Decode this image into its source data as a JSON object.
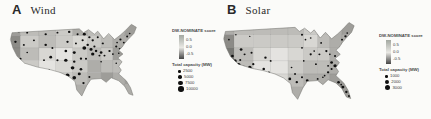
{
  "figure": {
    "background": "#fbfbf9"
  },
  "palette": {
    "grays": [
      "#f0efec",
      "#e4e3e0",
      "#d8d7d3",
      "#cbcac6",
      "#bdbcb8",
      "#aeada9",
      "#9e9d99",
      "#8c8b87",
      "#787874",
      "#616160"
    ],
    "dot_color": "#101010",
    "gradient_top": "#a3a8a1",
    "gradient_mid": "#e9e8e4",
    "gradient_bottom": "#454545",
    "outline_color": "#6e6e6a",
    "cell_border": "#00000022"
  },
  "us_outline": "M12,14 L92,9 L97,14 L103,10 L110,16 L114,12 L121,22 L127,15 L134,23 L141,17 L147,11 L154,3 L160,7 L157,15 L150,23 L146,28 L143,33 L139,37 L144,42 L138,47 L143,52 L139,58 L142,63 L139,68 L143,72 L148,77 L153,86 L156,96 L151,94 L146,84 L139,77 L130,73 L124,79 L118,74 L106,75 L101,83 L95,97 L89,89 L87,78 L79,71 L69,66 L56,62 L42,59 L27,54 L18,45 L13,34 L10,23 Z",
  "panels": [
    {
      "letter": "A",
      "title": "Wind",
      "score_legend": {
        "title": "DW-NOMINATE score",
        "ticks": [
          "0.5",
          "0.0",
          "-0.5"
        ]
      },
      "size_legend": {
        "title": "Total capacity (MW)",
        "items": [
          {
            "label": "2500",
            "d": 2.6
          },
          {
            "label": "5000",
            "d": 3.6
          },
          {
            "label": "7500",
            "d": 4.6
          },
          {
            "label": "10000",
            "d": 5.6
          }
        ]
      },
      "map": {
        "grid": {
          "cols": [
            0,
            22,
            44,
            64,
            84,
            102,
            118,
            132,
            146,
            160,
            174,
            200
          ],
          "rows": [
            0,
            18,
            34,
            50,
            66,
            82,
            110
          ],
          "shades": [
            "64435435676",
            "73432345567",
            "74213436566",
            "83123544565",
            "84234565656",
            "75345566567"
          ]
        },
        "dots": [
          [
            20,
            12,
            1.6
          ],
          [
            30,
            14,
            1.2
          ],
          [
            16,
            26,
            1.5
          ],
          [
            26,
            30,
            1.2
          ],
          [
            22,
            48,
            1.3
          ],
          [
            26,
            56,
            1.6
          ],
          [
            30,
            62,
            1.2
          ],
          [
            30,
            40,
            1.0
          ],
          [
            38,
            24,
            1.2
          ],
          [
            52,
            16,
            1.4
          ],
          [
            66,
            14,
            1.2
          ],
          [
            52,
            30,
            1.5
          ],
          [
            60,
            34,
            1.2
          ],
          [
            58,
            46,
            1.7
          ],
          [
            66,
            50,
            1.3
          ],
          [
            50,
            50,
            1.1
          ],
          [
            56,
            63,
            1.3
          ],
          [
            62,
            68,
            1.5
          ],
          [
            80,
            13,
            1.5
          ],
          [
            90,
            16,
            1.2
          ],
          [
            78,
            26,
            1.4
          ],
          [
            88,
            28,
            1.2
          ],
          [
            76,
            38,
            1.6
          ],
          [
            86,
            40,
            1.8
          ],
          [
            76,
            50,
            2.0
          ],
          [
            86,
            52,
            1.5
          ],
          [
            94,
            48,
            1.4
          ],
          [
            84,
            60,
            2.2
          ],
          [
            94,
            62,
            1.6
          ],
          [
            78,
            70,
            2.4
          ],
          [
            86,
            73,
            2.2
          ],
          [
            92,
            68,
            1.8
          ],
          [
            97,
            80,
            1.4
          ],
          [
            104,
            72,
            1.2
          ],
          [
            98,
            16,
            1.8
          ],
          [
            104,
            20,
            1.4
          ],
          [
            96,
            24,
            1.3
          ],
          [
            98,
            34,
            2.3
          ],
          [
            106,
            36,
            1.8
          ],
          [
            102,
            30,
            1.5
          ],
          [
            110,
            32,
            1.3
          ],
          [
            108,
            42,
            2.0
          ],
          [
            112,
            38,
            1.5
          ],
          [
            116,
            44,
            1.2
          ],
          [
            100,
            48,
            1.3
          ],
          [
            108,
            24,
            1.4
          ],
          [
            114,
            20,
            1.2
          ],
          [
            118,
            40,
            1.6
          ],
          [
            122,
            44,
            1.2
          ],
          [
            120,
            28,
            1.3
          ],
          [
            128,
            38,
            1.4
          ],
          [
            132,
            42,
            1.1
          ],
          [
            118,
            52,
            1.0
          ],
          [
            141,
            23,
            1.3
          ],
          [
            145,
            27,
            1.1
          ],
          [
            137,
            27,
            1.0
          ],
          [
            136,
            32,
            1.3
          ],
          [
            140,
            35,
            1.0
          ],
          [
            149,
            19,
            1.2
          ],
          [
            152,
            15,
            1.0
          ],
          [
            139,
            41,
            1.0
          ],
          [
            136,
            54,
            1.0
          ],
          [
            141,
            47,
            0.9
          ]
        ]
      }
    },
    {
      "letter": "B",
      "title": "Solar",
      "score_legend": {
        "title": "DW-NOMINATE score",
        "ticks": [
          "0.5",
          "0.0",
          "-0.5"
        ]
      },
      "size_legend": {
        "title": "Total capacity (MW)",
        "items": [
          {
            "label": "1000",
            "d": 2.6
          },
          {
            "label": "2000",
            "d": 3.8
          },
          {
            "label": "3000",
            "d": 5.0
          }
        ]
      },
      "map": {
        "grid": {
          "cols": [
            0,
            22,
            44,
            64,
            84,
            102,
            118,
            132,
            146,
            160,
            174,
            200
          ],
          "rows": [
            0,
            18,
            34,
            50,
            66,
            82,
            110
          ],
          "shades": [
            "54444345676",
            "73333245567",
            "84212335666",
            "84113445566",
            "74224556666",
            "65335566677"
          ]
        },
        "dots": [
          [
            20,
            44,
            1.6
          ],
          [
            23,
            50,
            2.0
          ],
          [
            27,
            55,
            2.4
          ],
          [
            30,
            60,
            2.0
          ],
          [
            34,
            62,
            1.7
          ],
          [
            25,
            60,
            1.5
          ],
          [
            22,
            54,
            1.3
          ],
          [
            29,
            49,
            1.2
          ],
          [
            33,
            57,
            1.1
          ],
          [
            36,
            64,
            1.4
          ],
          [
            30,
            36,
            1.6
          ],
          [
            34,
            42,
            1.2
          ],
          [
            40,
            58,
            2.0
          ],
          [
            46,
            62,
            1.6
          ],
          [
            44,
            54,
            1.3
          ],
          [
            42,
            40,
            1.2
          ],
          [
            56,
            60,
            1.5
          ],
          [
            62,
            64,
            1.2
          ],
          [
            58,
            46,
            1.4
          ],
          [
            64,
            50,
            1.1
          ],
          [
            86,
            72,
            1.6
          ],
          [
            94,
            76,
            1.4
          ],
          [
            100,
            70,
            1.2
          ],
          [
            106,
            74,
            1.5
          ],
          [
            92,
            66,
            1.1
          ],
          [
            88,
            58,
            1.0
          ],
          [
            100,
            18,
            1.2
          ],
          [
            104,
            24,
            1.0
          ],
          [
            110,
            22,
            1.0
          ],
          [
            100,
            34,
            1.1
          ],
          [
            110,
            42,
            1.3
          ],
          [
            114,
            38,
            1.0
          ],
          [
            120,
            42,
            1.2
          ],
          [
            128,
            38,
            1.3
          ],
          [
            132,
            42,
            1.0
          ],
          [
            122,
            28,
            1.1
          ],
          [
            102,
            50,
            1.0
          ],
          [
            116,
            54,
            1.1
          ],
          [
            130,
            64,
            1.4
          ],
          [
            134,
            60,
            1.2
          ],
          [
            126,
            68,
            1.0
          ],
          [
            142,
            76,
            1.5
          ],
          [
            147,
            82,
            1.7
          ],
          [
            151,
            88,
            1.4
          ],
          [
            154,
            93,
            1.2
          ],
          [
            145,
            79,
            1.0
          ],
          [
            134,
            52,
            1.6
          ],
          [
            138,
            56,
            1.9
          ],
          [
            142,
            58,
            1.3
          ],
          [
            130,
            56,
            1.1
          ],
          [
            138,
            44,
            1.2
          ],
          [
            142,
            46,
            1.0
          ],
          [
            142,
            38,
            1.1
          ],
          [
            144,
            34,
            1.3
          ],
          [
            146,
            30,
            1.0
          ],
          [
            146,
            24,
            1.2
          ],
          [
            150,
            20,
            1.4
          ],
          [
            152,
            16,
            1.0
          ],
          [
            148,
            28,
            0.9
          ],
          [
            118,
            72,
            1.1
          ],
          [
            124,
            70,
            1.0
          ],
          [
            18,
            12,
            1.1
          ],
          [
            16,
            24,
            1.0
          ],
          [
            24,
            18,
            0.9
          ],
          [
            40,
            20,
            0.9
          ]
        ]
      }
    }
  ]
}
